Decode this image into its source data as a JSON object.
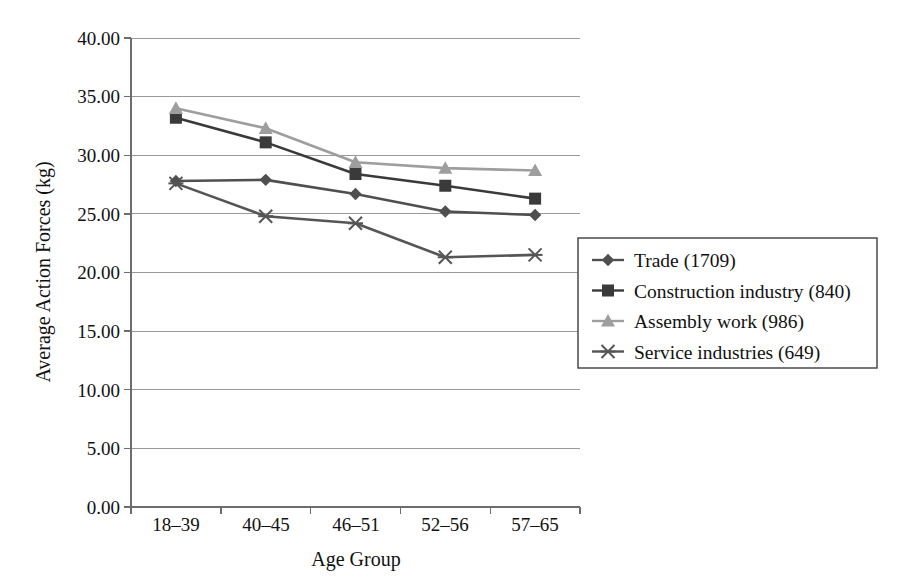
{
  "chart_data": {
    "type": "line",
    "title": "",
    "xlabel": "Age Group",
    "ylabel": "Average Action Forces (kg)",
    "categories": [
      "18–39",
      "40–45",
      "46–51",
      "52–56",
      "57–65"
    ],
    "ylim": [
      0,
      40
    ],
    "yticks": [
      0,
      5,
      10,
      15,
      20,
      25,
      30,
      35,
      40
    ],
    "ytick_labels": [
      "0.00",
      "5.00",
      "10.00",
      "15.00",
      "20.00",
      "25.00",
      "30.00",
      "35.00",
      "40.00"
    ],
    "grid": true,
    "legend_position": "right",
    "series": [
      {
        "name": "Trade (1709)",
        "marker": "diamond",
        "color": "#4f4f4f",
        "values": [
          27.8,
          27.9,
          26.7,
          25.2,
          24.9
        ]
      },
      {
        "name": "Construction industry (840)",
        "marker": "square",
        "color": "#3a3a3a",
        "values": [
          33.2,
          31.1,
          28.4,
          27.4,
          26.3
        ]
      },
      {
        "name": "Assembly work (986)",
        "marker": "triangle",
        "color": "#9e9e9e",
        "values": [
          34.0,
          32.3,
          29.4,
          28.9,
          28.7
        ]
      },
      {
        "name": "Service industries (649)",
        "marker": "cross",
        "color": "#555555",
        "values": [
          27.6,
          24.8,
          24.2,
          21.3,
          21.5
        ]
      }
    ]
  },
  "axes": {
    "y_title": "Average Action Forces (kg)",
    "x_title": "Age Group",
    "y_tick_0": "0.00",
    "y_tick_1": "5.00",
    "y_tick_2": "10.00",
    "y_tick_3": "15.00",
    "y_tick_4": "20.00",
    "y_tick_5": "25.00",
    "y_tick_6": "30.00",
    "y_tick_7": "35.00",
    "y_tick_8": "40.00",
    "x_tick_0": "18–39",
    "x_tick_1": "40–45",
    "x_tick_2": "46–51",
    "x_tick_3": "52–56",
    "x_tick_4": "57–65"
  },
  "legend": {
    "items": [
      {
        "label": "Trade (1709)"
      },
      {
        "label": "Construction industry (840)"
      },
      {
        "label": "Assembly work (986)"
      },
      {
        "label": "Service industries (649)"
      }
    ]
  },
  "colors": {
    "grid": "#9a9a9a",
    "axis": "#6d6d6d",
    "text": "#111111",
    "trade": "#4f4f4f",
    "construction": "#3a3a3a",
    "assembly": "#9e9e9e",
    "service": "#555555"
  }
}
